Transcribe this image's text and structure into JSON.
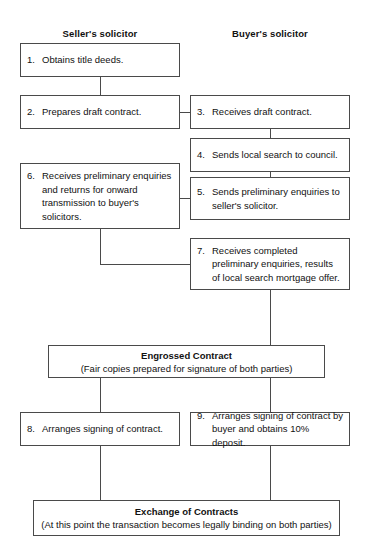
{
  "headings": {
    "seller": "Seller's solicitor",
    "buyer": "Buyer's solicitor"
  },
  "nodes": [
    {
      "id": "n1",
      "num": "1.",
      "text": "Obtains title deeds.",
      "column": "seller"
    },
    {
      "id": "n2",
      "num": "2.",
      "text": "Prepares draft contract.",
      "column": "seller"
    },
    {
      "id": "n3",
      "num": "3.",
      "text": "Receives draft contract.",
      "column": "buyer"
    },
    {
      "id": "n4",
      "num": "4.",
      "text": "Sends local search to council.",
      "column": "buyer"
    },
    {
      "id": "n5",
      "num": "5.",
      "text": "Sends preliminary enquiries to seller's solicitor.",
      "column": "buyer"
    },
    {
      "id": "n6",
      "num": "6.",
      "text": "Receives preliminary enquiries and returns for onward transmission to buyer's solicitors.",
      "column": "seller"
    },
    {
      "id": "n7",
      "num": "7.",
      "text": "Receives completed preliminary enquiries, results of local search mortgage offer.",
      "column": "buyer"
    },
    {
      "id": "n8",
      "num": "8.",
      "text": "Arranges signing of contract.",
      "column": "seller"
    },
    {
      "id": "n9",
      "num": "9.",
      "text": "Arranges signing of contract by buyer and obtains 10% deposit.",
      "column": "buyer"
    }
  ],
  "banners": [
    {
      "id": "engrossed",
      "title": "Engrossed Contract",
      "subtitle": "(Fair copies prepared for signature of both parties)"
    },
    {
      "id": "exchange",
      "title": "Exchange of Contracts",
      "subtitle": "(At this point the transaction becomes legally binding on both parties)"
    }
  ],
  "colors": {
    "border": "#4a4a4a",
    "text": "#111111",
    "background": "#ffffff"
  }
}
